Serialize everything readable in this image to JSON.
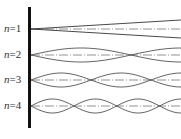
{
  "figure": {
    "wall_color": "#111111",
    "wave_color": "#555555",
    "axis_color": "#777777",
    "modes": [
      {
        "label_var": "n",
        "label_eq": "=1",
        "n": 1,
        "y": 29,
        "amplitude": 9,
        "nodes": []
      },
      {
        "label_var": "n",
        "label_eq": "=2",
        "n": 2,
        "y": 55,
        "amplitude": 7,
        "nodes": [
          130
        ]
      },
      {
        "label_var": "n",
        "label_eq": "=3",
        "n": 3,
        "y": 80,
        "amplitude": 7,
        "nodes": [
          91,
          152
        ]
      },
      {
        "label_var": "n",
        "label_eq": "=4",
        "n": 4,
        "y": 106,
        "amplitude": 7,
        "nodes": [
          74,
          118,
          160
        ]
      }
    ]
  }
}
